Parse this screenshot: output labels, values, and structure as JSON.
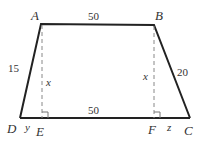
{
  "diagram": {
    "type": "trapezoid",
    "colors": {
      "stroke": "#222222",
      "dashed": "#888888",
      "text": "#333333",
      "background": "#ffffff"
    },
    "vertices": {
      "A": {
        "label": "A",
        "x": 41,
        "y": 24
      },
      "B": {
        "label": "B",
        "x": 154,
        "y": 25
      },
      "C": {
        "label": "C",
        "x": 190,
        "y": 118
      },
      "D": {
        "label": "D",
        "x": 20,
        "y": 118
      },
      "E": {
        "label": "E",
        "x": 42,
        "y": 118
      },
      "F": {
        "label": "F",
        "x": 154,
        "y": 118
      }
    },
    "edges": [
      {
        "from": "A",
        "to": "B",
        "label": "50"
      },
      {
        "from": "D",
        "to": "C",
        "label": "50"
      },
      {
        "from": "A",
        "to": "D",
        "label": "15"
      },
      {
        "from": "B",
        "to": "C",
        "label": "20"
      }
    ],
    "heights": [
      {
        "from": "A",
        "to": "E",
        "label": "x",
        "style": "dashed",
        "right_angle": true
      },
      {
        "from": "B",
        "to": "F",
        "label": "x",
        "style": "dashed",
        "right_angle": true
      }
    ],
    "segments": [
      {
        "from": "D",
        "to": "E",
        "label": "y"
      },
      {
        "from": "F",
        "to": "C",
        "label": "z"
      }
    ],
    "labels": {
      "top_base": "50",
      "bottom_base": "50",
      "left_leg": "15",
      "right_leg": "20",
      "height_left": "x",
      "height_right": "x",
      "seg_de": "y",
      "seg_fc": "z"
    }
  }
}
